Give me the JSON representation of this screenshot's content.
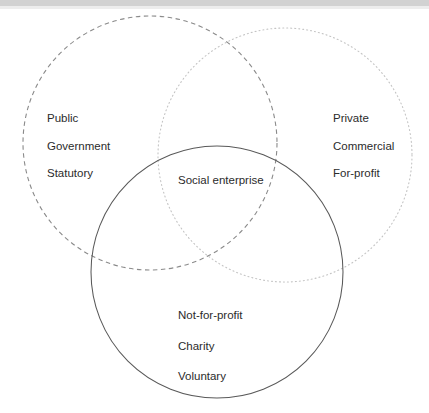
{
  "diagram": {
    "type": "venn",
    "background_color": "#ffffff",
    "text_color": "#2b2b2b",
    "circles": [
      {
        "name": "public-sector-circle",
        "stroke_style": "dashed",
        "stroke_color": "#8a8a8a",
        "cx": 150,
        "cy": 143,
        "r": 127
      },
      {
        "name": "private-sector-circle",
        "stroke_style": "dotted",
        "stroke_color": "#c4c4c4",
        "cx": 285,
        "cy": 155,
        "r": 127
      },
      {
        "name": "third-sector-circle",
        "stroke_style": "solid",
        "stroke_color": "#595959",
        "cx": 217,
        "cy": 272,
        "r": 126
      }
    ],
    "regions": {
      "public_sector": {
        "name": "public-sector",
        "lines": [
          "Public",
          "Government",
          "Statutory"
        ]
      },
      "private_sector": {
        "name": "private-sector",
        "lines": [
          "Private",
          "Commercial",
          "For-profit"
        ]
      },
      "intersection": {
        "name": "social-enterprise",
        "lines": [
          "Social enterprise"
        ]
      },
      "third_sector": {
        "name": "third-sector",
        "lines": [
          "Not-for-profit",
          "Charity",
          "Voluntary"
        ]
      }
    }
  }
}
